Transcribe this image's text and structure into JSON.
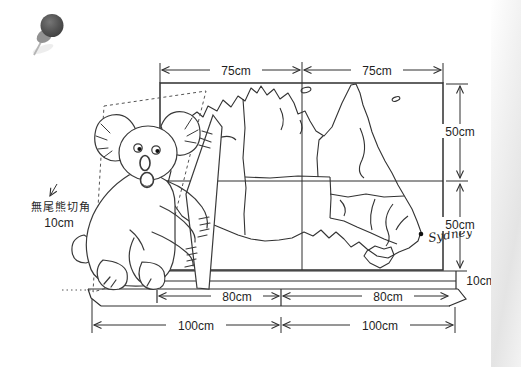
{
  "pushpin": {
    "icon": "pushpin-icon"
  },
  "dimensions": {
    "top_left": "75cm",
    "top_right": "75cm",
    "right_upper": "50cm",
    "right_lower": "50cm",
    "thickness": "10cm",
    "shelf_left": "80cm",
    "shelf_right": "80cm",
    "base_left": "100cm",
    "base_right": "100cm"
  },
  "annotations": {
    "koala_note_text": "無尾熊切角",
    "koala_note_value": "10cm",
    "city": "Sydney"
  },
  "colors": {
    "ink": "#2f2f2f",
    "pin": "#4f4f4f",
    "page_edge": "#e4e4e4"
  }
}
